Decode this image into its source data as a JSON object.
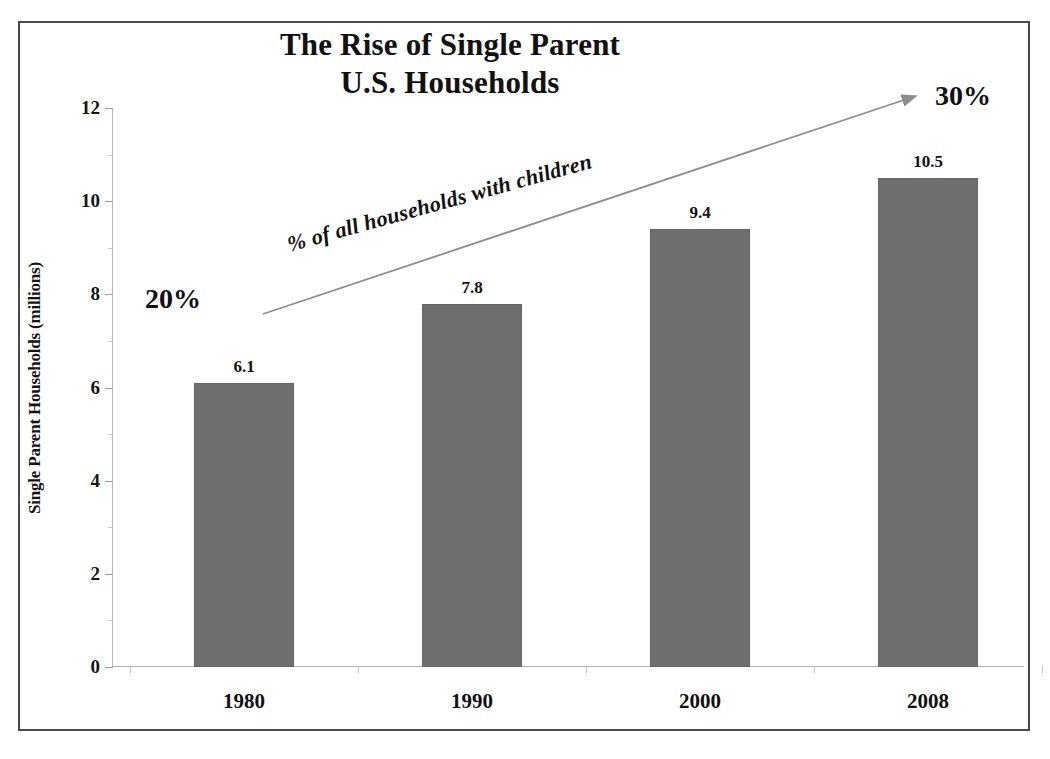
{
  "chart_data": {
    "type": "bar",
    "title": "The Rise of Single Parent U.S. Households",
    "title_line1": "The Rise of Single Parent",
    "title_line2": "U.S. Households",
    "subtitle": "",
    "xlabel": "",
    "ylabel": "Single Parent Households (millions)",
    "categories": [
      "1980",
      "1990",
      "2000",
      "2008"
    ],
    "values": [
      6.1,
      7.8,
      9.4,
      10.5
    ],
    "value_labels": [
      "6.1",
      "7.8",
      "9.4",
      "10.5"
    ],
    "ylim": [
      0,
      12
    ],
    "ytick_labels": [
      "0",
      "2",
      "4",
      "6",
      "8",
      "10",
      "12"
    ],
    "ytick_values": [
      0,
      2,
      4,
      6,
      8,
      10,
      12
    ],
    "yminor_values": [
      1,
      3,
      5,
      7,
      9,
      11
    ],
    "grid": false,
    "legend": "none",
    "bar_color": "#6e6e6e",
    "series": [
      {
        "name": "Single Parent Households (millions)",
        "values": [
          6.1,
          7.8,
          9.4,
          10.5
        ]
      }
    ],
    "annotations": [
      {
        "name": "trend-arrow",
        "text": "% of all households with children",
        "start_label": "20%",
        "end_label": "30%",
        "description": "Upward arrow from 20% at 1980 to 30% at 2008"
      }
    ]
  },
  "axis": {
    "y_title": "Single Parent Households (millions)",
    "y_ticks": [
      "0",
      "2",
      "4",
      "6",
      "8",
      "10",
      "12"
    ],
    "x_ticks": [
      "1980",
      "1990",
      "2000",
      "2008"
    ]
  },
  "annotation": {
    "arrow_text": "% of all households with children",
    "start_percent": "20%",
    "end_percent": "30%"
  },
  "title": {
    "line1": "The Rise of Single Parent",
    "line2": "U.S. Households"
  },
  "colors": {
    "bar": "#6e6e6e",
    "text": "#111111",
    "frame": "#4a4a4a",
    "axis": "#b4b4b4"
  }
}
